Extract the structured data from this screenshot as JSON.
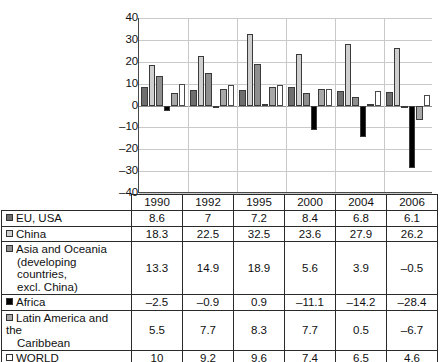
{
  "chart_data": {
    "type": "bar",
    "title": "",
    "xlabel": "",
    "ylabel": "",
    "ylim": [
      -40,
      40
    ],
    "ytick_step": 10,
    "yticks": [
      "40",
      "30",
      "20",
      "10",
      "0",
      "–10",
      "–20",
      "–30",
      "–40"
    ],
    "grid": true,
    "legend_position": "table-row-labels",
    "categories": [
      "1990",
      "1992",
      "1995",
      "2000",
      "2004",
      "2006"
    ],
    "series": [
      {
        "name": "EU, USA",
        "color": "#6e6e6e",
        "values": [
          8.6,
          7,
          7.2,
          8.4,
          6.8,
          6.1
        ]
      },
      {
        "name": "China",
        "color": "#cfcfcf",
        "values": [
          18.3,
          22.5,
          32.5,
          23.6,
          27.9,
          26.2
        ]
      },
      {
        "name": "Asia and Oceania (developing countries, excl. China)",
        "color": "#8f8f8f",
        "values": [
          13.3,
          14.9,
          18.9,
          5.6,
          3.9,
          -0.5
        ]
      },
      {
        "name": "Africa",
        "color": "#000000",
        "values": [
          -2.5,
          -0.9,
          0.9,
          -11.1,
          -14.2,
          -28.4
        ]
      },
      {
        "name": "Latin America and the Caribbean",
        "color": "#a8a8a8",
        "values": [
          5.5,
          7.7,
          8.3,
          7.7,
          0.5,
          -6.7
        ]
      },
      {
        "name": "WORLD",
        "color": "#ffffff",
        "values": [
          10,
          9.2,
          9.6,
          7.4,
          6.5,
          4.6
        ]
      }
    ]
  },
  "table": {
    "corner_label": "",
    "columns": [
      "1990",
      "1992",
      "1995",
      "2000",
      "2004",
      "2006"
    ],
    "rows": [
      {
        "swatch": "#6e6e6e",
        "label_lines": [
          "EU, USA"
        ],
        "values": [
          "8.6",
          "7",
          "7.2",
          "8.4",
          "6.8",
          "6.1"
        ]
      },
      {
        "swatch": "#cfcfcf",
        "label_lines": [
          "China"
        ],
        "values": [
          "18.3",
          "22.5",
          "32.5",
          "23.6",
          "27.9",
          "26.2"
        ]
      },
      {
        "swatch": "#8f8f8f",
        "label_lines": [
          "Asia and Oceania",
          "(developing countries,",
          "excl. China)"
        ],
        "values": [
          "13.3",
          "14.9",
          "18.9",
          "5.6",
          "3.9",
          "–0.5"
        ]
      },
      {
        "swatch": "#000000",
        "label_lines": [
          "Africa"
        ],
        "values": [
          "–2.5",
          "–0.9",
          "0.9",
          "–11.1",
          "–14.2",
          "–28.4"
        ]
      },
      {
        "swatch": "#a8a8a8",
        "label_lines": [
          "Latin America and the",
          "Caribbean"
        ],
        "values": [
          "5.5",
          "7.7",
          "8.3",
          "7.7",
          "0.5",
          "–6.7"
        ]
      },
      {
        "swatch": "#ffffff",
        "label_lines": [
          "WORLD"
        ],
        "values": [
          "10",
          "9.2",
          "9.6",
          "7.4",
          "6.5",
          "4.6"
        ]
      }
    ]
  }
}
